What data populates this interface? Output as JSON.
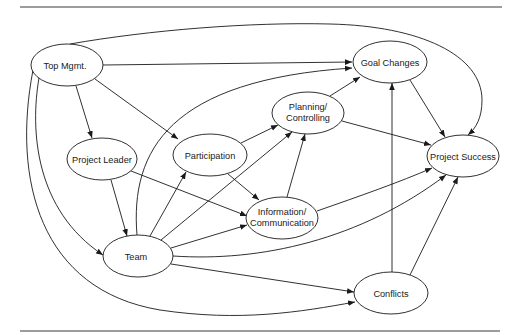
{
  "diagram": {
    "colors": {
      "stroke": "#1a1a1a",
      "background": "#ffffff",
      "rule": "#3a3a3a"
    },
    "nodes": {
      "top_mgmt": {
        "label": "Top Mgmt.",
        "cx": 67,
        "cy": 65,
        "rx": 36,
        "ry": 21
      },
      "project_leader": {
        "label": "Project Leader",
        "cx": 102,
        "cy": 159,
        "rx": 35,
        "ry": 21
      },
      "participation": {
        "label": "Participation",
        "cx": 210,
        "cy": 155,
        "rx": 37,
        "ry": 21
      },
      "planning": {
        "label_line1": "Planning/",
        "label_line2": "Controlling",
        "cx": 308,
        "cy": 113,
        "rx": 36,
        "ry": 21
      },
      "goal_changes": {
        "label": "Goal Changes",
        "cx": 390,
        "cy": 62,
        "rx": 37,
        "ry": 21
      },
      "project_success": {
        "label": "Project Success",
        "cx": 463,
        "cy": 156,
        "rx": 36,
        "ry": 21
      },
      "information": {
        "label_line1": "Information/",
        "label_line2": "Communication",
        "cx": 282,
        "cy": 218,
        "rx": 36,
        "ry": 21
      },
      "team": {
        "label": "Team",
        "cx": 138,
        "cy": 256,
        "rx": 35,
        "ry": 21
      },
      "conflicts": {
        "label": "Conflicts",
        "cx": 391,
        "cy": 293,
        "rx": 37,
        "ry": 21
      }
    },
    "edges": [
      {
        "from": "Top Mgmt.",
        "to": "Project Leader"
      },
      {
        "from": "Top Mgmt.",
        "to": "Participation"
      },
      {
        "from": "Top Mgmt.",
        "to": "Goal Changes"
      },
      {
        "from": "Top Mgmt.",
        "to": "Project Success"
      },
      {
        "from": "Top Mgmt.",
        "to": "Team"
      },
      {
        "from": "Top Mgmt.",
        "to": "Conflicts"
      },
      {
        "from": "Project Leader",
        "to": "Team"
      },
      {
        "from": "Project Leader",
        "to": "Information/Communication"
      },
      {
        "from": "Participation",
        "to": "Planning/Controlling"
      },
      {
        "from": "Participation",
        "to": "Information/Communication"
      },
      {
        "from": "Planning/Controlling",
        "to": "Goal Changes"
      },
      {
        "from": "Planning/Controlling",
        "to": "Project Success"
      },
      {
        "from": "Information/Communication",
        "to": "Planning/Controlling"
      },
      {
        "from": "Information/Communication",
        "to": "Project Success"
      },
      {
        "from": "Team",
        "to": "Goal Changes"
      },
      {
        "from": "Team",
        "to": "Participation"
      },
      {
        "from": "Team",
        "to": "Planning/Controlling"
      },
      {
        "from": "Team",
        "to": "Information/Communication"
      },
      {
        "from": "Team",
        "to": "Project Success"
      },
      {
        "from": "Team",
        "to": "Conflicts"
      },
      {
        "from": "Goal Changes",
        "to": "Project Success"
      },
      {
        "from": "Conflicts",
        "to": "Goal Changes"
      },
      {
        "from": "Conflicts",
        "to": "Project Success"
      }
    ]
  }
}
